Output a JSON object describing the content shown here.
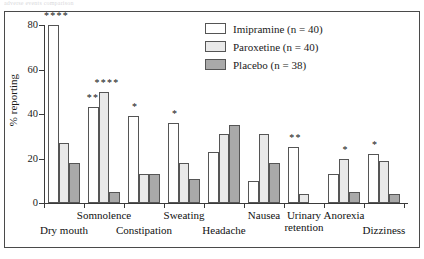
{
  "caption_strip": "adverse events  comparison",
  "axis": {
    "y_label": "% reporting",
    "y_ticks": [
      "0",
      "20",
      "40",
      "60",
      "80"
    ]
  },
  "legend": {
    "items": [
      {
        "label": "Imipramine (n = 40)",
        "key": "imipramine",
        "color": "#ffffff"
      },
      {
        "label": "Paroxetine (n = 40)",
        "key": "paroxetine",
        "color": "#e9e9e9"
      },
      {
        "label": "Placebo (n = 38)",
        "key": "placebo",
        "color": "#a9a9a9"
      }
    ]
  },
  "chart_data": {
    "type": "bar",
    "title": "",
    "xlabel": "",
    "ylabel": "% reporting",
    "ylim": [
      0,
      80
    ],
    "grid": false,
    "legend_position": "top-right",
    "categories": [
      "Dry mouth",
      "Somnolence",
      "Constipation",
      "Sweating",
      "Headache",
      "Nausea",
      "Urinary retention",
      "Anorexia",
      "Dizziness"
    ],
    "series": [
      {
        "name": "Imipramine (n = 40)",
        "color": "#ffffff",
        "values": [
          80,
          43,
          39,
          36,
          23,
          10,
          25,
          13,
          22
        ]
      },
      {
        "name": "Paroxetine (n = 40)",
        "color": "#e9e9e9",
        "values": [
          27,
          50,
          13,
          18,
          31,
          31,
          4,
          20,
          19
        ]
      },
      {
        "name": "Placebo (n = 38)",
        "color": "#a9a9a9",
        "values": [
          18,
          5,
          13,
          11,
          35,
          18,
          0,
          5,
          4
        ]
      }
    ],
    "annotations": [
      {
        "category": "Dry mouth",
        "series": "Imipramine (n = 40)",
        "text": "****"
      },
      {
        "category": "Somnolence",
        "series": "Imipramine (n = 40)",
        "text": "***"
      },
      {
        "category": "Somnolence",
        "series": "Paroxetine (n = 40)",
        "text": "****"
      },
      {
        "category": "Constipation",
        "series": "Imipramine (n = 40)",
        "text": "*"
      },
      {
        "category": "Sweating",
        "series": "Imipramine (n = 40)",
        "text": "*"
      },
      {
        "category": "Urinary retention",
        "series": "Imipramine (n = 40)",
        "text": "**"
      },
      {
        "category": "Anorexia",
        "series": "Paroxetine (n = 40)",
        "text": "*"
      },
      {
        "category": "Dizziness",
        "series": "Imipramine (n = 40)",
        "text": "*"
      }
    ]
  }
}
